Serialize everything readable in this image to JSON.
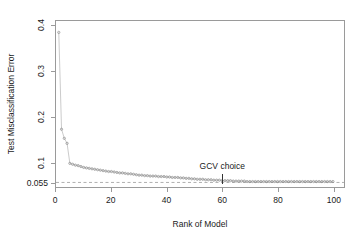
{
  "chart_data": {
    "type": "scatter",
    "title": "",
    "xlabel": "Rank of Model",
    "ylabel": "Test Misclassification Error",
    "xlim": [
      0,
      104
    ],
    "ylim": [
      0.045,
      0.41
    ],
    "grid": false,
    "legend": null,
    "marker": "open-circle",
    "marker_color": "#8c8c8c",
    "line_color": "#a8a8a8",
    "xticks": [
      0,
      20,
      40,
      60,
      80,
      100
    ],
    "xtick_labels": [
      "0",
      "20",
      "40",
      "60",
      "80",
      "100"
    ],
    "yticks": [
      0.055,
      0.1,
      0.2,
      0.3,
      0.4
    ],
    "ytick_labels": [
      "0.055",
      "0.1",
      "0.2",
      "0.3",
      "0.4"
    ],
    "reference_line": {
      "orientation": "horizontal",
      "value": 0.055,
      "label": "0.055",
      "style": "dashed",
      "color": "#8c8c8c"
    },
    "annotations": [
      {
        "text": "GCV choice",
        "x": 60,
        "y": 0.082,
        "marker": "vertical-tick",
        "tick_from": 0.075,
        "tick_to": 0.0545
      }
    ],
    "x": [
      1,
      2,
      3,
      4,
      5,
      6,
      7,
      8,
      9,
      10,
      11,
      12,
      13,
      14,
      15,
      16,
      17,
      18,
      19,
      20,
      21,
      22,
      23,
      24,
      25,
      26,
      27,
      28,
      29,
      30,
      31,
      32,
      33,
      34,
      35,
      36,
      37,
      38,
      39,
      40,
      41,
      42,
      43,
      44,
      45,
      46,
      47,
      48,
      49,
      50,
      51,
      52,
      53,
      54,
      55,
      56,
      57,
      58,
      59,
      60,
      61,
      62,
      63,
      64,
      65,
      66,
      67,
      68,
      69,
      70,
      71,
      72,
      73,
      74,
      75,
      76,
      77,
      78,
      79,
      80,
      81,
      82,
      83,
      84,
      85,
      86,
      87,
      88,
      89,
      90,
      91,
      92,
      93,
      94,
      95,
      96,
      97,
      98,
      99,
      100
    ],
    "values": [
      0.385,
      0.172,
      0.152,
      0.141,
      0.097,
      0.095,
      0.093,
      0.092,
      0.09,
      0.088,
      0.087,
      0.086,
      0.085,
      0.084,
      0.083,
      0.082,
      0.081,
      0.08,
      0.079,
      0.079,
      0.078,
      0.077,
      0.076,
      0.076,
      0.075,
      0.074,
      0.074,
      0.073,
      0.072,
      0.071,
      0.071,
      0.07,
      0.07,
      0.069,
      0.069,
      0.069,
      0.068,
      0.068,
      0.068,
      0.067,
      0.067,
      0.066,
      0.066,
      0.066,
      0.065,
      0.065,
      0.064,
      0.064,
      0.063,
      0.063,
      0.062,
      0.062,
      0.062,
      0.061,
      0.061,
      0.061,
      0.06,
      0.06,
      0.06,
      0.059,
      0.059,
      0.059,
      0.059,
      0.058,
      0.058,
      0.058,
      0.058,
      0.058,
      0.057,
      0.057,
      0.057,
      0.057,
      0.057,
      0.057,
      0.057,
      0.057,
      0.057,
      0.057,
      0.057,
      0.057,
      0.057,
      0.057,
      0.057,
      0.057,
      0.057,
      0.057,
      0.057,
      0.057,
      0.057,
      0.057,
      0.057,
      0.057,
      0.057,
      0.057,
      0.057,
      0.057,
      0.057,
      0.057,
      0.057,
      0.057
    ]
  }
}
